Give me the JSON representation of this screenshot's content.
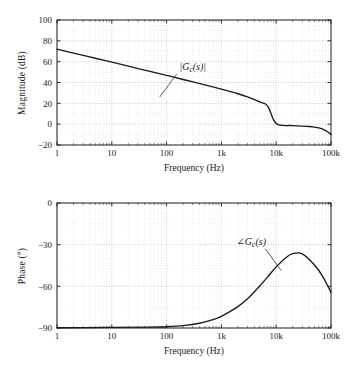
{
  "figure": {
    "kind": "bode-plot",
    "background": "#ffffff",
    "ink": "#1a1a1a",
    "grid_color": "#c8c8c8",
    "curve_color": "#1a1a1a"
  },
  "chart_data": [
    {
      "type": "line",
      "id": "magnitude",
      "title": "",
      "xlabel": "Frequency (Hz)",
      "ylabel": "Magnitude (dB)",
      "xscale": "log",
      "xlim": [
        1,
        100000
      ],
      "ylim": [
        -20,
        100
      ],
      "grid": true,
      "legend": "none",
      "xticks": [
        1,
        10,
        100,
        1000,
        10000,
        100000
      ],
      "xticklabels": [
        "1",
        "10",
        "100",
        "1k",
        "10k",
        "100k"
      ],
      "yticks": [
        -20,
        0,
        20,
        40,
        60,
        80,
        100
      ],
      "yticklabels": [
        "-20",
        "0",
        "20",
        "40",
        "60",
        "80",
        "100"
      ],
      "annotations": [
        {
          "text": "|Gc(s)|",
          "display": "|G_c(s)|",
          "x": 300,
          "y": 52
        }
      ],
      "series": [
        {
          "name": "|Gc(s)|",
          "x": [
            1,
            2,
            5,
            10,
            20,
            50,
            100,
            200,
            500,
            1000,
            2000,
            3000,
            5000,
            7000,
            10000,
            15000,
            20000,
            30000,
            50000,
            70000,
            100000
          ],
          "y": [
            72,
            68.2,
            63.3,
            59.5,
            55.7,
            50.6,
            46.8,
            42.9,
            37.7,
            33.6,
            29.2,
            26.2,
            21.4,
            17.4,
            12.6,
            7.2,
            4.1,
            1.2,
            -0.6,
            -1.6,
            -2.2
          ],
          "y_note": "magnitude rolls off near -20 dB/decade then flattens around 10k-50k before a final decline",
          "x_tail": [
            10000,
            20000,
            40000,
            60000,
            80000,
            100000
          ],
          "y_tail": [
            0.6,
            -1.4,
            -2.2,
            -3.6,
            -6.2,
            -9.8
          ]
        }
      ]
    },
    {
      "type": "line",
      "id": "phase",
      "title": "",
      "xlabel": "Frequency (Hz)",
      "ylabel": "Phase (°)",
      "xscale": "log",
      "xlim": [
        1,
        100000
      ],
      "ylim": [
        -90,
        0
      ],
      "grid": true,
      "legend": "none",
      "xticks": [
        1,
        10,
        100,
        1000,
        10000,
        100000
      ],
      "xticklabels": [
        "1",
        "10",
        "100",
        "1k",
        "10k",
        "100k"
      ],
      "yticks": [
        -90,
        -60,
        -30,
        0
      ],
      "yticklabels": [
        "-90",
        "-60",
        "-30",
        "0"
      ],
      "annotations": [
        {
          "text": "∠Gc(s)",
          "display": "∠G_c(s)",
          "x": 3500,
          "y": -30
        }
      ],
      "series": [
        {
          "name": "∠Gc(s)",
          "x": [
            1,
            10,
            50,
            100,
            200,
            400,
            700,
            1000,
            2000,
            3000,
            5000,
            7000,
            10000,
            15000,
            20000,
            30000,
            50000,
            70000,
            100000
          ],
          "y": [
            -89.8,
            -89.6,
            -89.4,
            -89.1,
            -88.3,
            -86.6,
            -84.0,
            -81.6,
            -74.6,
            -69.0,
            -59.8,
            -53.2,
            -46.0,
            -39.4,
            -36.4,
            -36.6,
            -44.6,
            -52.6,
            -64.4
          ],
          "peak": {
            "x": 20000,
            "y": -36,
            "note": "maximum phase lead near 17-20 kHz"
          }
        }
      ]
    }
  ],
  "magnitude": {
    "ylabel": "Magnitude (dB)",
    "xlabel": "Frequency (Hz)",
    "curve_label": "|Gc(s)|"
  },
  "phase": {
    "ylabel": "Phase (°)",
    "xlabel": "Frequency (Hz)",
    "curve_label": "∠Gc(s)"
  }
}
